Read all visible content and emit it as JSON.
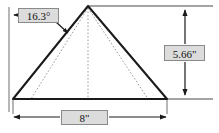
{
  "figure": {
    "type": "geometry-dimension-drawing",
    "shape_name": "pyramid",
    "stroke_color": "#1a1a1a",
    "hidden_edge_color": "#9a9a9a",
    "label_fill_color": "#dcdcdc",
    "label_border_color": "#8a8a8a",
    "background_color": "#ffffff"
  },
  "dimensions": {
    "angle": {
      "value": "16.3°",
      "role": "apex-half-angle",
      "points_to": "left-slant-edge"
    },
    "height": {
      "value": "5.66\"",
      "role": "vertical-height",
      "position": "right"
    },
    "base": {
      "value": "8\"",
      "role": "base-width",
      "position": "bottom"
    }
  },
  "geometry": {
    "apex": [
      88,
      6
    ],
    "base_left": [
      13,
      99
    ],
    "base_right": [
      167,
      99
    ],
    "hidden_front_left": [
      31,
      99
    ],
    "hidden_front_right": [
      148,
      99
    ],
    "hidden_vertical_top": [
      88,
      6
    ],
    "hidden_vertical_bottom": [
      88,
      99
    ]
  }
}
